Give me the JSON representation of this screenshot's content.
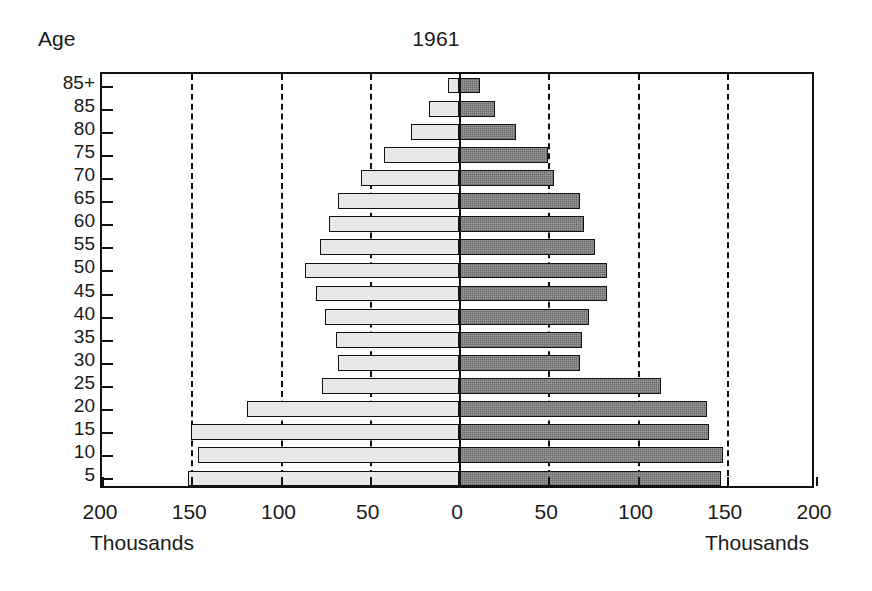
{
  "chart_data": {
    "type": "bar",
    "title": "1961",
    "subtitle": "",
    "orientation": "horizontal",
    "style": "population-pyramid",
    "xlabel": "Thousands",
    "ylabel": "Age",
    "units": "Thousands",
    "xlim": [
      -200,
      200
    ],
    "xticks": [
      200,
      150,
      100,
      50,
      0,
      50,
      100,
      150,
      200
    ],
    "xtick_labels": [
      "200",
      "150",
      "100",
      "50",
      "0",
      "50",
      "100",
      "150",
      "200"
    ],
    "grid": "vertical-dashed",
    "legend_position": "none",
    "categories": [
      "85+",
      "85",
      "80",
      "75",
      "70",
      "65",
      "60",
      "55",
      "50",
      "45",
      "40",
      "35",
      "30",
      "25",
      "20",
      "15",
      "10",
      "5"
    ],
    "series": [
      {
        "name": "left",
        "side": "left",
        "fill": "#e8e8e8",
        "values": [
          6,
          17,
          27,
          42,
          55,
          68,
          73,
          78,
          86,
          80,
          75,
          69,
          68,
          77,
          119,
          150,
          146,
          152
        ]
      },
      {
        "name": "right",
        "side": "right",
        "fill": "#9b9b9b",
        "values": [
          12,
          20,
          32,
          50,
          53,
          68,
          70,
          76,
          83,
          83,
          73,
          69,
          68,
          113,
          139,
          140,
          148,
          147
        ]
      }
    ]
  },
  "figure": {
    "title": "1961",
    "age_caption": "Age",
    "units_left": "Thousands",
    "units_right": "Thousands",
    "colors": {
      "left_bar": "#e8e8e8",
      "right_bar": "#9b9b9b",
      "axis": "#111111",
      "background": "#ffffff"
    }
  }
}
